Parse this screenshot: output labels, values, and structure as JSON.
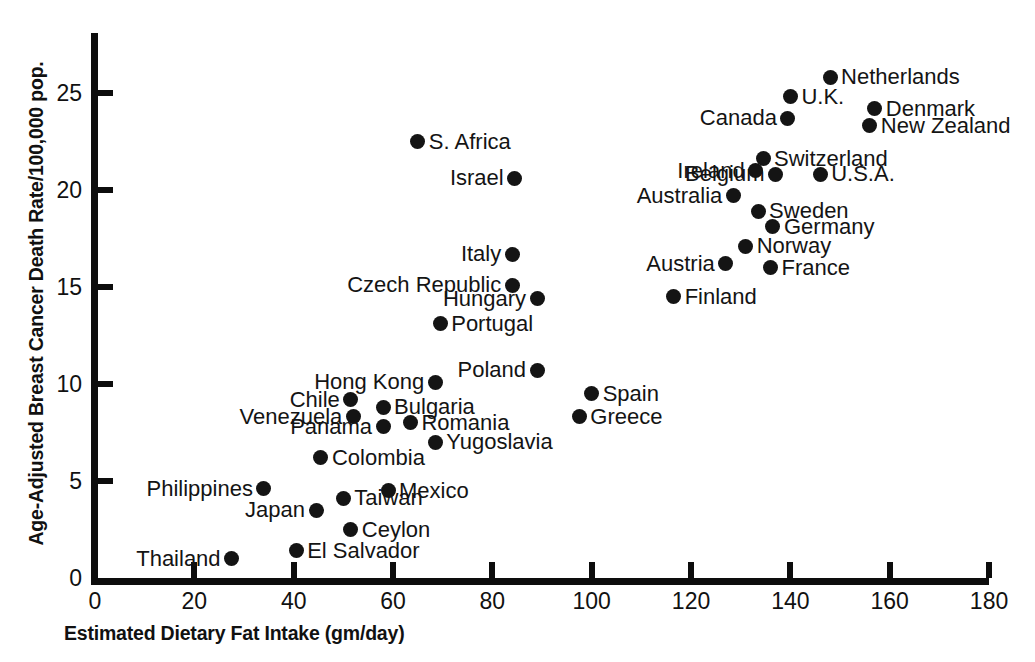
{
  "chart_data": {
    "type": "scatter",
    "title": "",
    "xlabel": "Estimated Dietary Fat Intake (gm/day)",
    "ylabel": "Age-Adjusted Breast Cancer Death Rate/100,000 pop.",
    "xlim": [
      0,
      180
    ],
    "ylim": [
      0,
      27.5
    ],
    "xticks": [
      0,
      20,
      40,
      60,
      80,
      100,
      120,
      140,
      160,
      180
    ],
    "yticks": [
      0,
      5,
      10,
      15,
      20,
      25
    ],
    "grid": false,
    "legend": false,
    "marker_color": "#141414",
    "points": [
      {
        "label": "Netherlands",
        "x": 148.0,
        "y": 25.8,
        "side": "right"
      },
      {
        "label": "U.K.",
        "x": 140.0,
        "y": 24.8,
        "side": "right"
      },
      {
        "label": "Denmark",
        "x": 157.0,
        "y": 24.2,
        "side": "right"
      },
      {
        "label": "Canada",
        "x": 139.5,
        "y": 23.7,
        "side": "left"
      },
      {
        "label": "New Zealand",
        "x": 156.0,
        "y": 23.3,
        "side": "right"
      },
      {
        "label": "S. Africa",
        "x": 65.0,
        "y": 22.5,
        "side": "right"
      },
      {
        "label": "Switzerland",
        "x": 134.5,
        "y": 21.6,
        "side": "right"
      },
      {
        "label": "Ireland",
        "x": 133.0,
        "y": 21.0,
        "side": "left"
      },
      {
        "label": "U.S.A.",
        "x": 146.0,
        "y": 20.8,
        "side": "right"
      },
      {
        "label": "Belgium",
        "x": 137.0,
        "y": 20.8,
        "side": "left"
      },
      {
        "label": "Israel",
        "x": 84.5,
        "y": 20.6,
        "side": "left"
      },
      {
        "label": "Australia",
        "x": 128.5,
        "y": 19.7,
        "side": "left"
      },
      {
        "label": "Sweden",
        "x": 133.5,
        "y": 18.9,
        "side": "right"
      },
      {
        "label": "Germany",
        "x": 136.5,
        "y": 18.1,
        "side": "right"
      },
      {
        "label": "Norway",
        "x": 131.0,
        "y": 17.1,
        "side": "right"
      },
      {
        "label": "Italy",
        "x": 84.0,
        "y": 16.7,
        "side": "left"
      },
      {
        "label": "Austria",
        "x": 127.0,
        "y": 16.2,
        "side": "left"
      },
      {
        "label": "France",
        "x": 136.0,
        "y": 16.0,
        "side": "right"
      },
      {
        "label": "Czech Republic",
        "x": 84.0,
        "y": 15.1,
        "side": "left"
      },
      {
        "label": "Hungary",
        "x": 89.0,
        "y": 14.4,
        "side": "left"
      },
      {
        "label": "Finland",
        "x": 116.5,
        "y": 14.5,
        "side": "right"
      },
      {
        "label": "Portugal",
        "x": 69.5,
        "y": 13.1,
        "side": "right"
      },
      {
        "label": "Poland",
        "x": 89.0,
        "y": 10.7,
        "side": "left"
      },
      {
        "label": "Hong Kong",
        "x": 68.5,
        "y": 10.1,
        "side": "left"
      },
      {
        "label": "Spain",
        "x": 100.0,
        "y": 9.5,
        "side": "right"
      },
      {
        "label": "Chile",
        "x": 51.5,
        "y": 9.2,
        "side": "left"
      },
      {
        "label": "Bulgaria",
        "x": 58.0,
        "y": 8.8,
        "side": "right"
      },
      {
        "label": "Greece",
        "x": 97.5,
        "y": 8.3,
        "side": "right"
      },
      {
        "label": "Venezuela",
        "x": 52.0,
        "y": 8.3,
        "side": "left"
      },
      {
        "label": "Romania",
        "x": 63.5,
        "y": 8.0,
        "side": "right"
      },
      {
        "label": "Panama",
        "x": 58.0,
        "y": 7.8,
        "side": "left"
      },
      {
        "label": "Yugoslavia",
        "x": 68.5,
        "y": 7.0,
        "side": "right"
      },
      {
        "label": "Colombia",
        "x": 45.5,
        "y": 6.2,
        "side": "right"
      },
      {
        "label": "Mexico",
        "x": 59.0,
        "y": 4.5,
        "side": "right"
      },
      {
        "label": "Philippines",
        "x": 34.0,
        "y": 4.6,
        "side": "left"
      },
      {
        "label": "Taiwan",
        "x": 50.0,
        "y": 4.1,
        "side": "right"
      },
      {
        "label": "Japan",
        "x": 44.5,
        "y": 3.5,
        "side": "left"
      },
      {
        "label": "Ceylon",
        "x": 51.5,
        "y": 2.5,
        "side": "right"
      },
      {
        "label": "El Salvador",
        "x": 40.5,
        "y": 1.4,
        "side": "right"
      },
      {
        "label": "Thailand",
        "x": 27.5,
        "y": 1.0,
        "side": "left"
      }
    ]
  },
  "axes": {
    "x_tick_labels": [
      "0",
      "20",
      "40",
      "60",
      "80",
      "100",
      "120",
      "140",
      "160",
      "180"
    ],
    "y_tick_labels": [
      "0",
      "5",
      "10",
      "15",
      "20",
      "25"
    ]
  }
}
